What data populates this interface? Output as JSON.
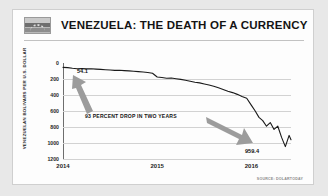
{
  "header": {
    "title": "VENEZUELA: THE DEATH OF A CURRENCY",
    "flag_icon": "venezuela-flag-icon"
  },
  "source_note": "SOURCE: DOLARTODAY",
  "annotations": {
    "start_value": "54.1",
    "end_value": "959.4",
    "callout": "93 PERCENT DROP IN TWO YEARS",
    "arrow_up_icon": "arrow-up-left-icon",
    "arrow_down_icon": "arrow-down-right-icon"
  },
  "chart_data": {
    "type": "line",
    "title": "VENEZUELA: THE DEATH OF A CURRENCY",
    "xlabel": "",
    "ylabel": "VENEZUELAN BOLIVARS PER U.S. DOLLAR",
    "y_ticks": [
      "0",
      "200",
      "400",
      "600",
      "800",
      "1000",
      "1200"
    ],
    "y_tick_values": [
      0,
      200,
      400,
      600,
      800,
      1000,
      1200
    ],
    "ylim": [
      0,
      1200
    ],
    "y_inverted": true,
    "x_ticks": [
      "2014",
      "2015",
      "2016"
    ],
    "x_tick_values": [
      2014,
      2015,
      2016
    ],
    "xlim": [
      2014.0,
      2016.42
    ],
    "grid": "horizontal",
    "legend": "none",
    "line_color": "#1a1a1a",
    "series": [
      {
        "name": "Bolivars per U.S. dollar (black market)",
        "x": [
          2014.0,
          2014.05,
          2014.1,
          2014.15,
          2014.2,
          2014.25,
          2014.3,
          2014.35,
          2014.4,
          2014.45,
          2014.5,
          2014.55,
          2014.6,
          2014.65,
          2014.7,
          2014.75,
          2014.8,
          2014.85,
          2014.9,
          2014.95,
          2015.0,
          2015.05,
          2015.1,
          2015.15,
          2015.2,
          2015.25,
          2015.3,
          2015.35,
          2015.4,
          2015.45,
          2015.5,
          2015.55,
          2015.6,
          2015.65,
          2015.7,
          2015.75,
          2015.8,
          2015.85,
          2015.9,
          2015.95,
          2016.0,
          2016.04,
          2016.08,
          2016.12,
          2016.16,
          2016.2,
          2016.24,
          2016.28,
          2016.32,
          2016.36,
          2016.4,
          2016.42
        ],
        "y": [
          54.1,
          58,
          66,
          72,
          70,
          74,
          71,
          76,
          80,
          84,
          88,
          92,
          90,
          95,
          99,
          104,
          108,
          112,
          118,
          128,
          175,
          182,
          190,
          188,
          196,
          205,
          215,
          228,
          240,
          248,
          262,
          275,
          290,
          310,
          330,
          352,
          370,
          392,
          418,
          440,
          530,
          600,
          680,
          720,
          790,
          745,
          830,
          790,
          930,
          1045,
          905,
          959.4
        ]
      }
    ],
    "annotations": [
      {
        "label": "54.1",
        "x": 2014.0,
        "y": 54.1
      },
      {
        "label": "959.4",
        "x": 2016.42,
        "y": 959.4
      },
      {
        "label": "93 PERCENT DROP IN TWO YEARS",
        "x": 2014.55,
        "y": 700
      }
    ]
  }
}
